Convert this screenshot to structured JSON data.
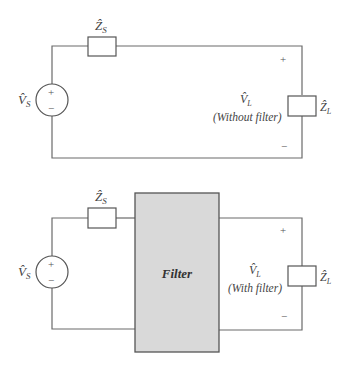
{
  "top_circuit": {
    "source_label": "V̂",
    "source_sub": "S",
    "source_plus": "+",
    "source_minus": "−",
    "series_impedance_label": "Ẑ",
    "series_impedance_sub": "S",
    "load_voltage_label": "V̂",
    "load_voltage_sub": "L",
    "load_caption": "(Without filter)",
    "load_plus": "+",
    "load_minus": "−",
    "load_impedance_label": "Ẑ",
    "load_impedance_sub": "L"
  },
  "bottom_circuit": {
    "source_label": "V̂",
    "source_sub": "S",
    "source_plus": "+",
    "source_minus": "−",
    "series_impedance_label": "Ẑ",
    "series_impedance_sub": "S",
    "filter_label": "Filter",
    "filter_fill": "#d9d9d9",
    "load_voltage_label": "V̂",
    "load_voltage_sub": "L",
    "load_caption": "(With filter)",
    "load_plus": "+",
    "load_minus": "−",
    "load_impedance_label": "Ẑ",
    "load_impedance_sub": "L"
  }
}
